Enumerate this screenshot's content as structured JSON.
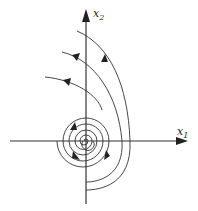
{
  "diagram": {
    "type": "phase-portrait",
    "axes": {
      "x_label": "x",
      "x_sub": "1",
      "y_label": "x",
      "y_sub": "2"
    },
    "line_color": "#333333",
    "icons": [
      "arrowhead-icon"
    ]
  }
}
